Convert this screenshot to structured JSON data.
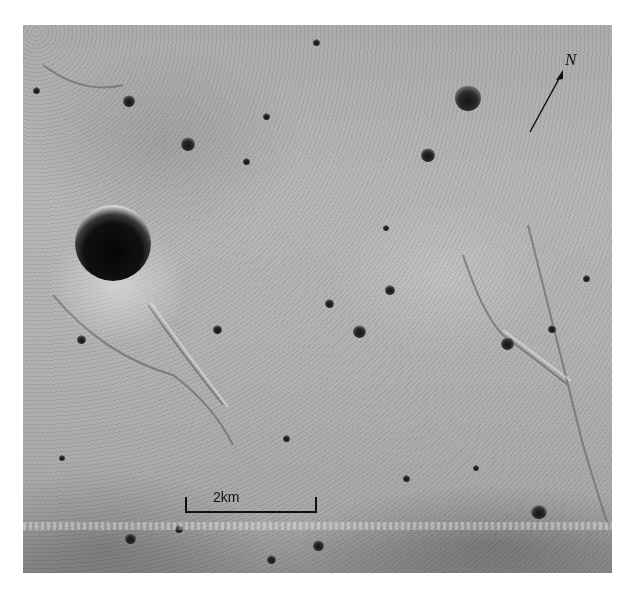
{
  "image": {
    "subject": "grayscale aerial photograph of lunar surface with craters and rilles",
    "scale_bar": {
      "label": "2km"
    },
    "north_arrow": {
      "label": "N"
    }
  },
  "colors": {
    "background": "#ffffff",
    "terrain": "#b4b4b4",
    "crater_shadow": "#101010",
    "annotation_ink": "#111111"
  }
}
